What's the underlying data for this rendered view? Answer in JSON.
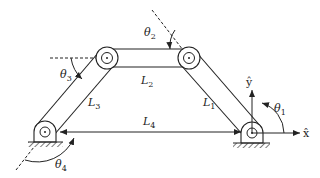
{
  "diagram": {
    "colors": {
      "stroke": "#222222",
      "background": "#ffffff"
    },
    "links": [
      {
        "id": "L1",
        "label": "L",
        "subscript": "1"
      },
      {
        "id": "L2",
        "label": "L",
        "subscript": "2"
      },
      {
        "id": "L3",
        "label": "L",
        "subscript": "3"
      },
      {
        "id": "L4",
        "label": "L",
        "subscript": "4"
      }
    ],
    "angles": [
      {
        "id": "theta1",
        "label": "θ",
        "subscript": "1"
      },
      {
        "id": "theta2",
        "label": "θ",
        "subscript": "2"
      },
      {
        "id": "theta3",
        "label": "θ",
        "subscript": "3"
      },
      {
        "id": "theta4",
        "label": "θ",
        "subscript": "4"
      }
    ],
    "axes": {
      "x": "x̂",
      "y": "ŷ"
    }
  }
}
